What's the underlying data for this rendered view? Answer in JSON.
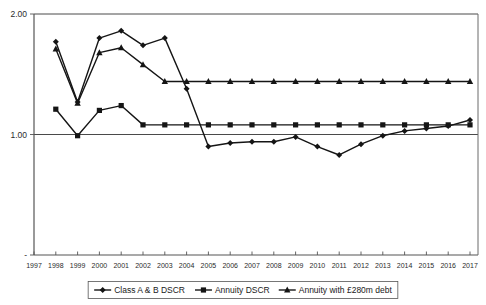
{
  "chart_data": {
    "type": "line",
    "title": "",
    "xlabel": "",
    "ylabel": "",
    "ylim": [
      0,
      2.0
    ],
    "xlim": [
      1997,
      2017
    ],
    "grid": true,
    "y_ticks": [
      "2.00",
      "1.00",
      "-"
    ],
    "y_tick_values": [
      2.0,
      1.0,
      0.0
    ],
    "legend_position": "bottom",
    "categories": [
      1997,
      1998,
      1999,
      2000,
      2001,
      2002,
      2003,
      2004,
      2005,
      2006,
      2007,
      2008,
      2009,
      2010,
      2011,
      2012,
      2013,
      2014,
      2015,
      2016,
      2017
    ],
    "x_tick_labels": [
      "1997",
      "1998",
      "1999",
      "2000",
      "2001",
      "2002",
      "2003",
      "2004",
      "2005",
      "2006",
      "2007",
      "2008",
      "2009",
      "2010",
      "2011",
      "2012",
      "2013",
      "2014",
      "2015",
      "2016",
      "2017"
    ],
    "series": [
      {
        "name": "Class A & B DSCR",
        "marker": "diamond",
        "values": [
          null,
          1.77,
          1.27,
          1.8,
          1.86,
          1.74,
          1.8,
          1.38,
          0.9,
          0.93,
          0.94,
          0.94,
          0.98,
          0.9,
          0.83,
          0.92,
          0.99,
          1.03,
          1.05,
          1.07,
          1.12
        ]
      },
      {
        "name": "Annuity DSCR",
        "marker": "square",
        "values": [
          null,
          1.21,
          0.99,
          1.2,
          1.24,
          1.08,
          1.08,
          1.08,
          1.08,
          1.08,
          1.08,
          1.08,
          1.08,
          1.08,
          1.08,
          1.08,
          1.08,
          1.08,
          1.08,
          1.08,
          1.08
        ]
      },
      {
        "name": "Annuity with £280m debt",
        "marker": "triangle",
        "values": [
          null,
          1.71,
          1.26,
          1.68,
          1.72,
          1.58,
          1.44,
          1.44,
          1.44,
          1.44,
          1.44,
          1.44,
          1.44,
          1.44,
          1.44,
          1.44,
          1.44,
          1.44,
          1.44,
          1.44,
          1.44
        ]
      }
    ]
  },
  "legend": {
    "items": [
      {
        "label": "Class A & B DSCR",
        "marker": "diamond"
      },
      {
        "label": "Annuity DSCR",
        "marker": "square"
      },
      {
        "label": "Annuity with £280m debt",
        "marker": "triangle"
      }
    ]
  },
  "colors": {
    "series": "#151515",
    "axis": "#555555",
    "grid": "#4a4a4a",
    "background": "#ffffff"
  }
}
